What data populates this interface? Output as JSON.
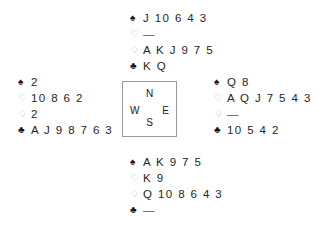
{
  "diagram": {
    "type": "bridge-deal-diagram",
    "background_color": "#ffffff",
    "suit_symbols": {
      "spade": "♠",
      "heart": "♡",
      "diamond": "♢",
      "club": "♣"
    },
    "suit_colors": {
      "spade": "#111111",
      "heart": "#b9b9b9",
      "diamond": "#b9b9b9",
      "club": "#111111"
    },
    "void_marker": "—"
  },
  "compass": {
    "north": "N",
    "west": "W",
    "east": "E",
    "south": "S",
    "border_color": "#9a9a9a"
  },
  "hands": {
    "north": {
      "position_label": "North",
      "spades": "J 10 6 4 3",
      "hearts": "—",
      "diamonds": "A K J 9 7 5",
      "clubs": "K Q"
    },
    "west": {
      "position_label": "West",
      "spades": "2",
      "hearts": "10 8 6 2",
      "diamonds": "2",
      "clubs": "A J 9 8 7 6 3"
    },
    "east": {
      "position_label": "East",
      "spades": "Q 8",
      "hearts": "A Q J 7 5 4 3",
      "diamonds": "—",
      "clubs": "10 5 4 2"
    },
    "south": {
      "position_label": "South",
      "spades": "A K 9 7 5",
      "hearts": "K 9",
      "diamonds": "Q 10 8 6 4 3",
      "clubs": "—"
    }
  }
}
